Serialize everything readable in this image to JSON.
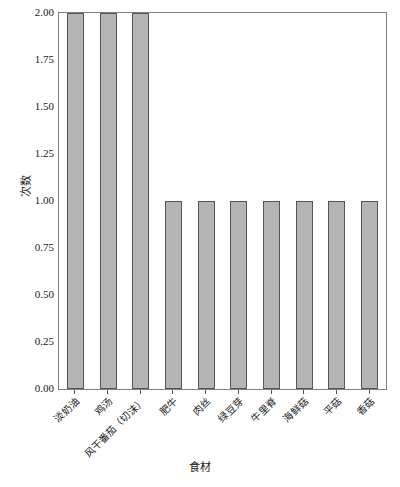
{
  "chart_data": {
    "type": "bar",
    "title": "",
    "xlabel": "食材",
    "ylabel": "次数",
    "categories": [
      "淡奶油",
      "鸡汤",
      "风干番茄（切沫）",
      "肥牛",
      "肉丝",
      "绿豆芽",
      "牛里脊",
      "海鲜菇",
      "平菇",
      "香菇"
    ],
    "values": [
      2,
      2,
      2,
      1,
      1,
      1,
      1,
      1,
      1,
      1
    ],
    "ylim": [
      0,
      2.0
    ],
    "yticks": [
      "0.00",
      "0.25",
      "0.50",
      "0.75",
      "1.00",
      "1.25",
      "1.50",
      "1.75",
      "2.00"
    ],
    "ytick_values": [
      0,
      0.25,
      0.5,
      0.75,
      1.0,
      1.25,
      1.5,
      1.75,
      2.0
    ],
    "grid": false,
    "legend": null,
    "bar_color": "#b4b4b4",
    "bar_edge_color": "#555555",
    "background_color": "#ffffff",
    "frame_color": "#808080",
    "xtick_rotation": 45
  }
}
